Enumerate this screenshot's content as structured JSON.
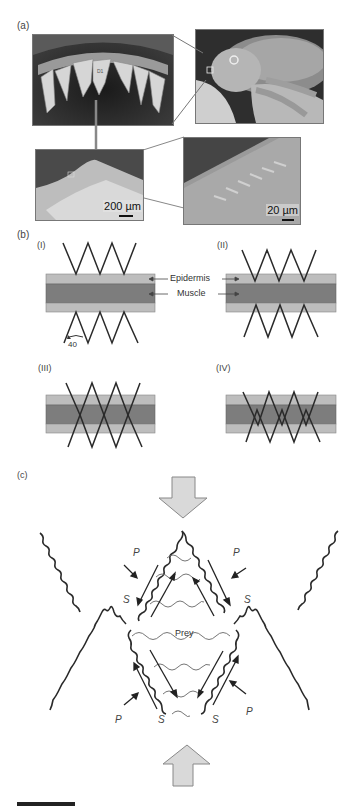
{
  "figure": {
    "panels": {
      "a": {
        "label": "(a)",
        "images": [
          {
            "name": "piranha-teeth-closeup",
            "scale": ""
          },
          {
            "name": "piranha-held-in-hand",
            "scale": ""
          },
          {
            "name": "tooth-tip-micrograph",
            "scale": "200 µm"
          },
          {
            "name": "tooth-edge-serration-micrograph",
            "scale": "20 µm"
          }
        ]
      },
      "b": {
        "label": "(b)",
        "subpanels": [
          {
            "label": "(I)"
          },
          {
            "label": "(II)"
          },
          {
            "label": "(III)"
          },
          {
            "label": "(IV)"
          }
        ],
        "layer_labels": {
          "epidermis": "Epidermis",
          "muscle": "Muscle"
        },
        "angle_label": "40",
        "colors": {
          "epidermis": "#bdbdbd",
          "muscle": "#7d7d7d",
          "tooth_line": "#2a2a2a"
        }
      },
      "c": {
        "label": "(c)",
        "prey_label": "Prey",
        "force_labels": {
          "P": "P",
          "S": "S"
        },
        "arrow_fill": "#d9d9d9"
      }
    }
  }
}
